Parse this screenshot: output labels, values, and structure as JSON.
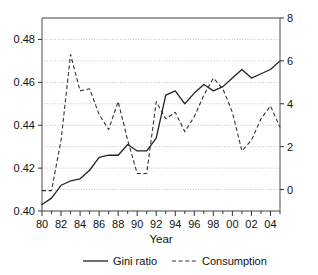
{
  "chart_data": {
    "type": "line",
    "title": "",
    "xlabel": "Year",
    "ylabel": "",
    "x": [
      1980,
      1981,
      1982,
      1983,
      1984,
      1985,
      1986,
      1987,
      1988,
      1989,
      1990,
      1991,
      1992,
      1993,
      1994,
      1995,
      1996,
      1997,
      1998,
      1999,
      2000,
      2001,
      2002,
      2003,
      2004,
      2005
    ],
    "xtick_labels": [
      "80",
      "82",
      "84",
      "86",
      "88",
      "90",
      "92",
      "94",
      "96",
      "98",
      "00",
      "02",
      "04"
    ],
    "xtick_values": [
      1980,
      1982,
      1984,
      1986,
      1988,
      1990,
      1992,
      1994,
      1996,
      1998,
      2000,
      2002,
      2004
    ],
    "xlim": [
      1980,
      2005
    ],
    "grid": true,
    "legend_position": "bottom",
    "series": [
      {
        "name": "Gini ratio",
        "axis": "left",
        "style": "solid",
        "color": "#222222",
        "ylabel": "",
        "ylim": [
          0.4,
          0.49
        ],
        "ytick_labels": [
          "0.40",
          "0.42",
          "0.44",
          "0.46",
          "0.48"
        ],
        "ytick_values": [
          0.4,
          0.42,
          0.44,
          0.46,
          0.48
        ],
        "values": [
          0.403,
          0.406,
          0.412,
          0.414,
          0.415,
          0.419,
          0.425,
          0.426,
          0.426,
          0.431,
          0.428,
          0.428,
          0.434,
          0.454,
          0.456,
          0.45,
          0.455,
          0.459,
          0.456,
          0.458,
          0.462,
          0.466,
          0.462,
          0.464,
          0.466,
          0.47
        ]
      },
      {
        "name": "Consumption",
        "axis": "right",
        "style": "dashed",
        "color": "#333333",
        "ylabel": "",
        "ylim": [
          -1.0,
          8.0
        ],
        "ytick_labels": [
          "0",
          "2",
          "4",
          "6",
          "8"
        ],
        "ytick_values": [
          0,
          2,
          4,
          6,
          8
        ],
        "values": [
          -0.05,
          -0.05,
          2.3,
          6.3,
          4.6,
          4.7,
          3.5,
          2.8,
          4.1,
          2.3,
          0.75,
          0.75,
          4.1,
          3.3,
          3.6,
          2.7,
          3.4,
          4.4,
          5.2,
          4.7,
          3.6,
          1.8,
          2.3,
          3.3,
          3.9,
          2.9
        ]
      }
    ]
  },
  "axes": {
    "x_axis_title": "Year",
    "left_axis_ticks": [
      "0.48",
      "0.46",
      "0.44",
      "0.42",
      "0.40"
    ],
    "right_axis_ticks": [
      "8",
      "6",
      "4",
      "2",
      "0"
    ],
    "x_axis_ticks": [
      "80",
      "82",
      "84",
      "86",
      "88",
      "90",
      "92",
      "94",
      "96",
      "98",
      "00",
      "02",
      "04"
    ]
  },
  "legend": {
    "items": [
      {
        "label": "Gini ratio",
        "style": "solid"
      },
      {
        "label": "Consumption",
        "style": "dashed"
      }
    ]
  },
  "colors": {
    "gini": "#222222",
    "consumption": "#333333",
    "grid": "#aaaaaa",
    "frame": "#808080",
    "background": "#ffffff"
  }
}
